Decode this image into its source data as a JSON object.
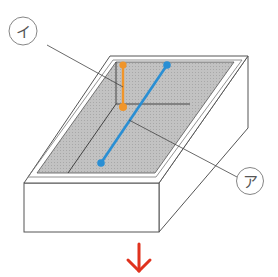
{
  "diagram": {
    "labels": {
      "a": "ア",
      "i": "イ"
    },
    "colors": {
      "floor": "#b9b9b9",
      "outline": "#555555",
      "orange_segment": "#f0952a",
      "blue_segment": "#2a8fd4",
      "arrow": "#e0321e",
      "leader_line": "#444444"
    },
    "elements": [
      "open-box-tray",
      "shaded-floor",
      "orange-vertical-segment",
      "blue-diagonal-segment",
      "down-arrow"
    ]
  }
}
